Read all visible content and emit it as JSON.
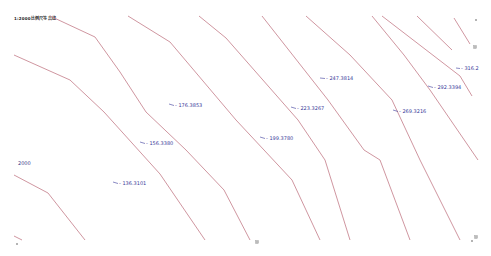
{
  "title": "1:2000比例尺等高线",
  "side_label": "2000",
  "line_color": "#c98a95",
  "label_color": "#3a3a9a",
  "contours": [
    {
      "id": "c1",
      "points": "14,236 22,240"
    },
    {
      "id": "c2",
      "points": "14,175 48,193 85,240"
    },
    {
      "id": "c3",
      "points": "14,55 70,80 104,112 160,174 205,240"
    },
    {
      "id": "c4",
      "points": "50,16 95,37 120,72 146,112 186,150 224,190 250,240"
    },
    {
      "id": "c5",
      "points": "128,16 170,42 236,120 292,180 320,240"
    },
    {
      "id": "c6",
      "points": "199,16 226,38 298,120 325,160 350,240"
    },
    {
      "id": "c7",
      "points": "262,16 328,100 364,150 380,160 410,240"
    },
    {
      "id": "c8",
      "points": "306,16 350,55 392,100 420,160 440,200 460,240"
    },
    {
      "id": "c9",
      "points": "372,16 404,55 430,90 478,160"
    },
    {
      "id": "c10",
      "points": "382,16 460,76 472,96"
    },
    {
      "id": "c11",
      "points": "417,16 452,50"
    },
    {
      "id": "c12",
      "points": "454,18 470,44"
    }
  ],
  "labels": [
    {
      "text": "176.3853",
      "x": 175,
      "y": 107,
      "tx": 169,
      "ty": 104
    },
    {
      "text": "156.3380",
      "x": 146,
      "y": 145,
      "tx": 140,
      "ty": 142
    },
    {
      "text": "136.3101",
      "x": 119,
      "y": 185,
      "tx": 113,
      "ty": 182
    },
    {
      "text": "199.3780",
      "x": 266,
      "y": 140,
      "tx": 260,
      "ty": 137
    },
    {
      "text": "223.3267",
      "x": 297,
      "y": 110,
      "tx": 291,
      "ty": 107
    },
    {
      "text": "247.3814",
      "x": 326,
      "y": 80,
      "tx": 320,
      "ty": 78
    },
    {
      "text": "269.3216",
      "x": 399,
      "y": 113,
      "tx": 393,
      "ty": 110
    },
    {
      "text": "292.3394",
      "x": 434,
      "y": 89,
      "tx": 428,
      "ty": 86
    },
    {
      "text": "316.2",
      "x": 461,
      "y": 70,
      "tx": 456,
      "ty": 68
    }
  ],
  "markers": [
    {
      "name": "marker-top-right",
      "x": 475,
      "y": 47
    },
    {
      "name": "marker-bottom-center",
      "x": 257,
      "y": 242
    },
    {
      "name": "marker-bottom-right",
      "x": 476,
      "y": 237
    }
  ],
  "points": [
    {
      "name": "point-top-right",
      "x": 476,
      "y": 20
    },
    {
      "name": "point-bottom-left",
      "x": 17,
      "y": 244
    },
    {
      "name": "point-bottom-right",
      "x": 472,
      "y": 241
    }
  ]
}
